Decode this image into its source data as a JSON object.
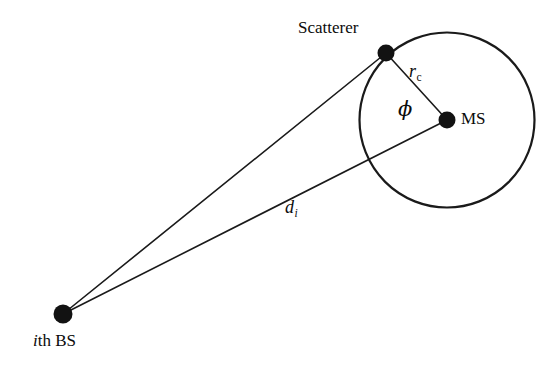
{
  "figure": {
    "domain": "diagram",
    "background_color": "#ffffff",
    "stroke_color": "#1a1a1a",
    "width": 557,
    "height": 370
  },
  "nodes": {
    "scatterer": {
      "label": "Scatterer",
      "dot_name": "scatterer-dot",
      "x": 386,
      "y": 53,
      "dot_radius": 8.5
    },
    "mobile_station": {
      "label": "MS",
      "dot_name": "ms-dot",
      "x": 447,
      "y": 120,
      "dot_radius": 8.5
    },
    "base_station": {
      "label_italic": "i",
      "label_rest": "th BS",
      "dot_name": "bs-dot",
      "x": 63,
      "y": 314,
      "dot_radius": 9.5
    }
  },
  "circle": {
    "name": "scattering-circle",
    "center_x": 447,
    "center_y": 120,
    "radius": 87.5,
    "stroke_width": 2.2
  },
  "edges": [
    {
      "name": "bs-to-scatterer-line",
      "x1": 63,
      "y1": 314,
      "x2": 386,
      "y2": 53
    },
    {
      "name": "bs-to-ms-line",
      "x1": 63,
      "y1": 314,
      "x2": 447,
      "y2": 120
    },
    {
      "name": "ms-to-scatterer-line",
      "x1": 447,
      "y1": 120,
      "x2": 386,
      "y2": 53
    }
  ],
  "annotations": {
    "scatter_radius": {
      "symbol": "r",
      "subscript": "c",
      "meaning": "scatterer-ring-radius"
    },
    "angle": {
      "symbol": "ϕ",
      "meaning": "angle-of-arrival-phi"
    },
    "distance": {
      "symbol": "d",
      "subscript": "i",
      "meaning": "bs-to-ms-distance"
    }
  }
}
